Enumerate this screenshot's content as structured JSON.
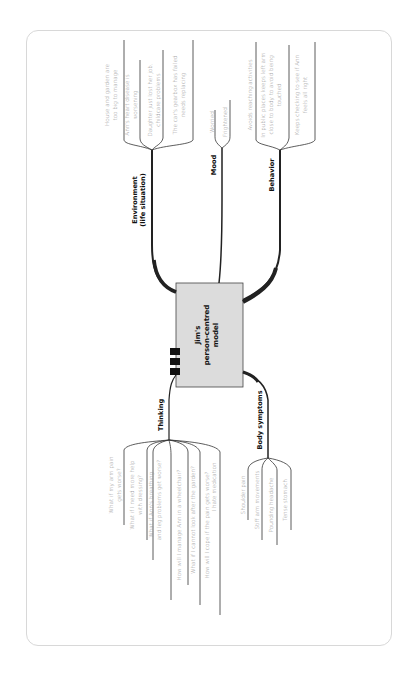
{
  "diagram": {
    "title_lines": [
      "Jim's",
      "person-centred",
      "model"
    ],
    "center_box_color": "#dcdcdc",
    "branches": {
      "environment": {
        "label_lines": [
          "Environment",
          "(life situation)"
        ],
        "items": [
          [
            "House and garden are",
            "too big to manage"
          ],
          [
            "Ann's heart disease is",
            "worsening"
          ],
          [
            "Daughter just lost her job,",
            "childcare problems"
          ],
          [
            "The car's gearbox has failed",
            "needs replacing"
          ]
        ]
      },
      "mood": {
        "label": "Mood",
        "items": [
          "Worried",
          "Frightened"
        ]
      },
      "behavior": {
        "label": "Behavior",
        "items": [
          [
            "Avoids reaching activities"
          ],
          [
            "In public places keeps left arm",
            "close to body to avoid being",
            "touched"
          ],
          [
            "Keeps checking to see if Ann",
            "feels all right"
          ]
        ]
      },
      "thinking": {
        "label": "Thinking",
        "items": [
          [
            "What if my arm pain",
            "gets worse?"
          ],
          [
            "What if I need more help",
            "with dressing?"
          ],
          [
            "What if Ann's breathing",
            "and leg problems get worse?"
          ],
          [
            "How will I manage Ann in a wheelchair?"
          ],
          [
            "What if I cannot look after the garden?"
          ],
          [
            "How will I cope if the pain gets worse?"
          ],
          [
            "I hate medication"
          ]
        ]
      },
      "body_symptoms": {
        "label": "Body symptoms",
        "items": [
          "Shoulder pain",
          "Stiff arm movements",
          "Pounding headache",
          "Tense stomach"
        ]
      }
    },
    "colors": {
      "line": "#222222",
      "leaf_text": "#8a8a8a",
      "branch_text": "#111111",
      "card_border": "#d8d8d8"
    }
  }
}
